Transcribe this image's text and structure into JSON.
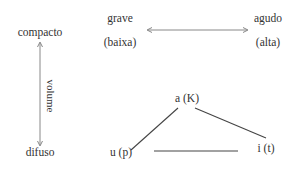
{
  "diagram": {
    "vertical_axis": {
      "top_label": "compacto",
      "bottom_label": "difuso",
      "axis_label": "volume"
    },
    "horizontal_axis": {
      "left_label": "grave",
      "left_sublabel": "(baixa)",
      "right_label": "agudo",
      "right_sublabel": "(alta)"
    },
    "triangle": {
      "top_vertex": "a (K)",
      "bottom_left_vertex": "u (p)",
      "bottom_right_vertex": "i (t)"
    },
    "colors": {
      "line": "#444444",
      "arrow": "#888888",
      "text": "#333333"
    }
  }
}
